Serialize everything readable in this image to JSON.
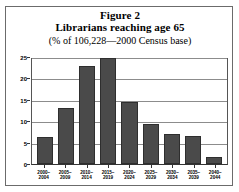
{
  "figure": {
    "number_label": "Figure 2",
    "title": "Librarians reaching age 65",
    "subtitle": "(% of 106,228—2000 Census base)"
  },
  "chart_data": {
    "type": "bar",
    "title": "Librarians reaching age 65",
    "subtitle": "(% of 106,228—2000 Census base)",
    "xlabel": "",
    "ylabel": "",
    "categories": [
      "2000–\n2004",
      "2005–\n2009",
      "2010–\n2014",
      "2015–\n2019",
      "2020–\n2024",
      "2025–\n2029",
      "2030–\n2034",
      "2035–\n2039",
      "2040–\n2044"
    ],
    "values": [
      6.2,
      13.2,
      22.8,
      24.7,
      14.5,
      9.3,
      7.1,
      6.5,
      1.7
    ],
    "ylim": [
      0,
      25
    ],
    "yticks": [
      0,
      5,
      10,
      15,
      20,
      25
    ],
    "ytick_labels": [
      "0",
      "5",
      "10",
      "15",
      "20",
      "25"
    ],
    "grid": true,
    "legend": false,
    "bar_color": "#4a4a4a",
    "bar_edge_color": "#2e2e2e",
    "gridline_color": "#8c8c8c",
    "axis_color": "#333333"
  }
}
